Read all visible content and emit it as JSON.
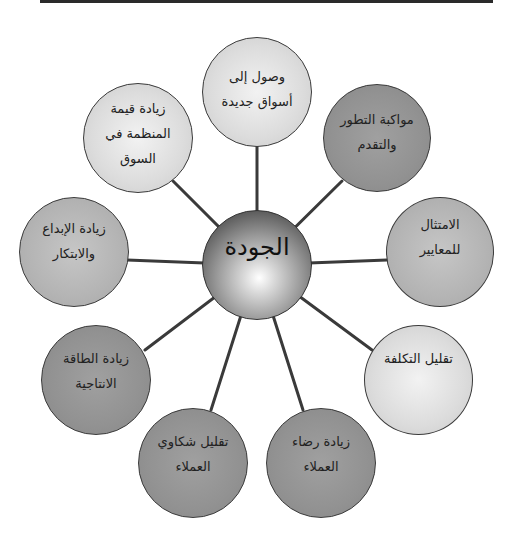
{
  "diagram": {
    "type": "radial-hub",
    "center": {
      "label": "الجودة"
    },
    "nodes": [
      {
        "label": "وصول إلى\nأسواق جديدة",
        "shade": "light"
      },
      {
        "label": "مواكبة التطور\nوالتقدم",
        "shade": "dark"
      },
      {
        "label": "الامتثال\nللمعايير",
        "shade": "mid"
      },
      {
        "label": "تقليل التكلفة",
        "shade": "light"
      },
      {
        "label": "زيادة رضاء\nالعملاء",
        "shade": "dark"
      },
      {
        "label": "تقليل شكاوي\nالعملاء",
        "shade": "dark"
      },
      {
        "label": "زيادة الطاقة\nالانتاجية",
        "shade": "dark"
      },
      {
        "label": "زيادة الإبداع\nوالابتكار",
        "shade": "mid"
      },
      {
        "label": "زيادة قيمة\nالمنظمة في\nالسوق",
        "shade": "light"
      }
    ]
  },
  "colors": {
    "light": "#dcdcdc",
    "mid": "#b4b4b4",
    "dark": "#929292",
    "connector": "#3a3a3a",
    "rule": "#2a2a2a"
  }
}
